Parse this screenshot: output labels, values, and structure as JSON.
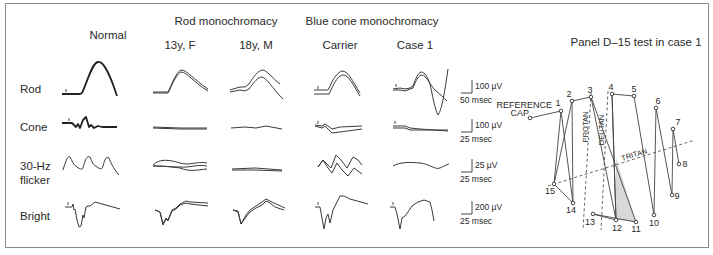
{
  "figure": {
    "column_groups": [
      {
        "label": "Normal",
        "x": 108,
        "y": 39
      },
      {
        "label": "Rod monochromacy",
        "x": 226,
        "y": 25
      },
      {
        "label": "Blue cone monochromacy",
        "x": 372,
        "y": 25
      }
    ],
    "columns": [
      {
        "label": "13y, F",
        "x": 180,
        "y": 49
      },
      {
        "label": "18y, M",
        "x": 256,
        "y": 49
      },
      {
        "label": "Carrier",
        "x": 340,
        "y": 49
      },
      {
        "label": "Case 1",
        "x": 415,
        "y": 49
      }
    ],
    "rows": [
      {
        "label": "Rod",
        "x": 20,
        "y": 93
      },
      {
        "label": "Cone",
        "x": 20,
        "y": 131
      },
      {
        "label": "30-Hz",
        "x": 20,
        "y": 170
      },
      {
        "label": "flicker",
        "x": 20,
        "y": 184
      },
      {
        "label": "Bright",
        "x": 20,
        "y": 220
      }
    ],
    "scale_bars": [
      {
        "amplitude": "100 µV",
        "time": "50 msec",
        "x": 472,
        "y": 93
      },
      {
        "amplitude": "100 µV",
        "time": "25 msec",
        "x": 472,
        "y": 132
      },
      {
        "amplitude": "25 µV",
        "time": "25 msec",
        "x": 472,
        "y": 172
      },
      {
        "amplitude": "200 µV",
        "time": "25 msec",
        "x": 472,
        "y": 214
      }
    ],
    "traces": [
      {
        "name": "normal-rod",
        "bold": true,
        "d": "M62,94 L80,94 L82,93 C88,80 92,63 98,62 C104,61 110,75 117,96"
      },
      {
        "name": "normal-cone",
        "bold": true,
        "d": "M62,123 L72,123 L76,127 L78,124 L80,128 L83,120 L86,117 L89,127 L91,125 L94,128 L98,126 L102,127 L117,127"
      },
      {
        "name": "normal-flicker",
        "bold": false,
        "d": "M63,170 C66,160 68,155 70,157 C72,160 73,165 77,167 C80,169 82,170 83,168 C85,160 87,155 90,157 C92,162 93,165 97,167 C100,169 102,170 103,166 C105,159 106,156 109,158 C111,163 113,168 119,175"
      },
      {
        "name": "normal-bright",
        "bold": false,
        "d": "M65,207 L72,207 L73,204 L74,210 L75,209 L77,220 L79,227 L81,226 L83,215 L84,218 L86,207 L88,206 L90,206 L95,202 L120,209"
      },
      {
        "name": "rm13-rod-a",
        "bold": false,
        "d": "M153,92 L168,92 L170,88 C174,78 178,71 181,70 C187,70 193,79 208,89"
      },
      {
        "name": "rm13-rod-b",
        "bold": false,
        "d": "M153,93 L168,93 L170,89 C174,80 178,73 181,72 C187,72 193,82 208,91"
      },
      {
        "name": "rm13-cone-a",
        "bold": false,
        "d": "M153,127 L180,128 L207,128"
      },
      {
        "name": "rm13-cone-b",
        "bold": false,
        "d": "M153,128 L180,129 L207,129"
      },
      {
        "name": "rm13-flicker-a",
        "bold": false,
        "d": "M153,165 C160,158 170,160 180,163 C190,166 196,161 207,163"
      },
      {
        "name": "rm13-flicker-b",
        "bold": false,
        "d": "M153,166 C165,166 172,167 180,167 C190,168 196,164 207,166"
      },
      {
        "name": "rm13-flicker-c",
        "bold": false,
        "d": "M153,166 C165,166 172,167 180,168 C190,172 196,170 207,169"
      },
      {
        "name": "rm13-bright-a",
        "bold": false,
        "d": "M155,210 L160,212 L163,224 L166,218 L168,220 L172,210 L176,208 L180,204 L186,201 L190,202 L208,203"
      },
      {
        "name": "rm13-bright-b",
        "bold": false,
        "d": "M155,210 L160,212 L163,225 L166,219 L168,221 L172,211 L176,209 L180,205 L186,203 L190,204 L208,206"
      },
      {
        "name": "rm18-rod-a",
        "bold": false,
        "d": "M230,90 L240,87 L245,87 L249,84 C254,76 258,71 262,70 C267,70 272,78 280,84"
      },
      {
        "name": "rm18-rod-b",
        "bold": false,
        "d": "M230,92 L240,90 L245,91 L249,89 C254,82 258,77 262,77 C267,78 272,88 283,99"
      },
      {
        "name": "rm18-cone",
        "bold": false,
        "d": "M231,128 L245,127 L256,128 L266,126 L282,129"
      },
      {
        "name": "rm18-flicker-a",
        "bold": false,
        "d": "M232,169 L255,168 L282,170"
      },
      {
        "name": "rm18-flicker-b",
        "bold": false,
        "d": "M232,170 L255,170 L282,171"
      },
      {
        "name": "rm18-bright-a",
        "bold": false,
        "d": "M233,210 L238,211 L241,224 L246,215 L250,210 L256,206 L262,202 L266,199 L270,201 L274,203 L285,208"
      },
      {
        "name": "rm18-bright-b",
        "bold": false,
        "d": "M233,210 L238,212 L241,224 L246,217 L250,212 L256,208 L262,205 L266,201 L270,203 L275,207 L284,210"
      },
      {
        "name": "bc-carrier-rod-a",
        "bold": false,
        "d": "M314,90 L328,90 L330,86 C334,77 338,72 342,71 C348,71 352,80 360,93"
      },
      {
        "name": "bc-carrier-rod-b",
        "bold": false,
        "d": "M314,94 L329,94 L331,90 C335,81 339,75 343,75 C349,75 353,85 360,96"
      },
      {
        "name": "bc-carrier-cone-a",
        "bold": false,
        "d": "M315,125 L322,126 L325,124 L328,126 L332,129 L340,127 L362,126"
      },
      {
        "name": "bc-carrier-cone-b",
        "bold": false,
        "d": "M315,126 L322,128 L325,126 L328,129 L332,133 L340,132 L362,129"
      },
      {
        "name": "bc-carrier-flicker-a",
        "bold": false,
        "d": "M318,167 L323,160 L328,165 L331,168 L336,155 L341,160 L347,168 L353,157 L358,160 L362,165"
      },
      {
        "name": "bc-carrier-flicker-b",
        "bold": false,
        "d": "M318,167 L323,160 L328,168 L332,173 L337,163 L342,170 L348,176 L354,168 L362,174"
      },
      {
        "name": "bc-carrier-bright",
        "bold": false,
        "d": "M315,207 L320,207 L322,218 L324,229 L326,218 L328,214 L330,223 L333,210 L335,206 L340,196 L344,196 L350,199 L368,204"
      },
      {
        "name": "bc-case1-rod-a",
        "bold": false,
        "d": "M393,89 L400,88 L405,89 L410,88 L413,86 C416,78 418,73 421,72 C425,72 428,78 430,84 C432,93 435,110 438,115 C442,110 445,90 448,69"
      },
      {
        "name": "bc-case1-rod-b",
        "bold": false,
        "d": "M393,90 L400,90 L405,91 L410,89 L413,88 C416,80 419,75 422,75 C426,75 430,85 435,90 C440,94 444,98 447,101"
      },
      {
        "name": "bc-case1-cone-a",
        "bold": false,
        "d": "M393,126 L405,126 L410,128 L420,129 L448,131"
      },
      {
        "name": "bc-case1-cone-b",
        "bold": false,
        "d": "M393,128 L405,128 L410,130 L420,130 L448,130"
      },
      {
        "name": "bc-case1-flicker",
        "bold": false,
        "d": "M393,166 C400,162 410,162 420,163 C430,164 435,170 440,168 C444,166 446,165 449,164"
      },
      {
        "name": "bc-case1-bright",
        "bold": false,
        "d": "M390,207 L395,207 L397,214 L400,229 L402,218 L405,216 L408,212 L412,206 L418,202 L424,200 L430,202 L432,210 L434,221"
      }
    ],
    "d15_panel": {
      "title": "Panel D–15 test in case 1",
      "title_x": 636,
      "title_y": 46,
      "reference_label_1": "REFERENCE",
      "reference_label_2": "CAP",
      "reference": {
        "x": 530,
        "y": 118
      },
      "caps": [
        {
          "n": "1",
          "x": 561,
          "y": 111,
          "lx": 558,
          "ly": 106
        },
        {
          "n": "2",
          "x": 572,
          "y": 101,
          "lx": 569,
          "ly": 97
        },
        {
          "n": "3",
          "x": 591,
          "y": 97,
          "lx": 590,
          "ly": 93
        },
        {
          "n": "4",
          "x": 612,
          "y": 94,
          "lx": 611,
          "ly": 90
        },
        {
          "n": "5",
          "x": 634,
          "y": 96,
          "lx": 634,
          "ly": 92
        },
        {
          "n": "6",
          "x": 656,
          "y": 108,
          "lx": 658,
          "ly": 104
        },
        {
          "n": "7",
          "x": 673,
          "y": 129,
          "lx": 678,
          "ly": 125
        },
        {
          "n": "8",
          "x": 679,
          "y": 164,
          "lx": 685,
          "ly": 167
        },
        {
          "n": "9",
          "x": 672,
          "y": 195,
          "lx": 677,
          "ly": 199
        },
        {
          "n": "10",
          "x": 654,
          "y": 215,
          "lx": 654,
          "ly": 226
        },
        {
          "n": "11",
          "x": 636,
          "y": 222,
          "lx": 636,
          "ly": 232
        },
        {
          "n": "12",
          "x": 616,
          "y": 220,
          "lx": 617,
          "ly": 231
        },
        {
          "n": "13",
          "x": 593,
          "y": 214,
          "lx": 590,
          "ly": 225
        },
        {
          "n": "14",
          "x": 573,
          "y": 203,
          "lx": 571,
          "ly": 213
        },
        {
          "n": "15",
          "x": 554,
          "y": 184,
          "lx": 550,
          "ly": 194
        }
      ],
      "sequence": [
        "ref",
        "1",
        "14",
        "2",
        "3",
        "12",
        "4",
        "5",
        "10",
        "6",
        "9",
        "7",
        "8"
      ],
      "extra_segments": [
        [
          "15",
          "14"
        ],
        [
          "13",
          "11"
        ],
        [
          "13",
          "12"
        ],
        [
          "12",
          "4"
        ],
        [
          "11",
          "3"
        ]
      ],
      "shaded_region": [
        [
          616,
          158
        ],
        [
          636,
          222
        ],
        [
          616,
          220
        ]
      ],
      "confusion_axes": [
        {
          "label": "PROTAN",
          "x1": 591,
          "y1": 93,
          "x2": 583,
          "y2": 230,
          "lx": 588,
          "ly": 127,
          "rot": -90
        },
        {
          "label": "DEUTAN",
          "x1": 608,
          "y1": 91,
          "x2": 601,
          "y2": 230,
          "lx": 604,
          "ly": 130,
          "rot": -90
        },
        {
          "label": "TRITAN",
          "x1": 548,
          "y1": 186,
          "x2": 695,
          "y2": 140,
          "lx": 635,
          "ly": 157,
          "rot": -17
        }
      ]
    }
  }
}
